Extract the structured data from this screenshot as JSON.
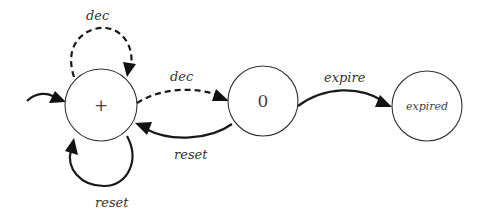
{
  "diagram": {
    "type": "state-machine",
    "states": [
      {
        "id": "plus",
        "label": "+",
        "cx": 101,
        "cy": 105,
        "r": 36,
        "initial": true
      },
      {
        "id": "zero",
        "label": "0",
        "cx": 263,
        "cy": 101,
        "r": 35
      },
      {
        "id": "expired",
        "label": "expired",
        "cx": 427,
        "cy": 106,
        "r": 35
      }
    ],
    "transitions": [
      {
        "id": "dec-self",
        "from": "plus",
        "to": "plus",
        "label": "dec",
        "style": "dashed"
      },
      {
        "id": "reset-self",
        "from": "plus",
        "to": "plus",
        "label": "reset",
        "style": "solid"
      },
      {
        "id": "dec-plus-zero",
        "from": "plus",
        "to": "zero",
        "label": "dec",
        "style": "dashed"
      },
      {
        "id": "reset-zero-plus",
        "from": "zero",
        "to": "plus",
        "label": "reset",
        "style": "solid"
      },
      {
        "id": "expire-zero-expired",
        "from": "zero",
        "to": "expired",
        "label": "expire",
        "style": "solid"
      }
    ],
    "colors": {
      "stroke": "#1a1a1a",
      "text": "#333333",
      "background": "#ffffff"
    }
  }
}
